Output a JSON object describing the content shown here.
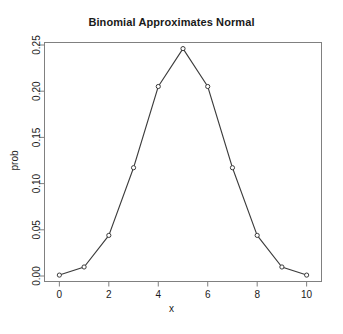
{
  "chart_data": {
    "type": "line",
    "title": "Binomial Approximates Normal",
    "xlabel": "x",
    "ylabel": "prob",
    "x": [
      0,
      1,
      2,
      3,
      4,
      5,
      6,
      7,
      8,
      9,
      10
    ],
    "values": [
      0.0009765625,
      0.009765625,
      0.043945313,
      0.1171875,
      0.205078125,
      0.24609375,
      0.205078125,
      0.1171875,
      0.043945313,
      0.009765625,
      0.0009765625
    ],
    "categories": [
      "0",
      "1",
      "2",
      "3",
      "4",
      "5",
      "6",
      "7",
      "8",
      "9",
      "10"
    ],
    "xlim": [
      -0.5,
      10.5
    ],
    "ylim": [
      0.0,
      0.25
    ],
    "xticks": [
      0,
      2,
      4,
      6,
      8,
      10
    ],
    "xtick_labels": [
      "0",
      "2",
      "4",
      "6",
      "8",
      "10"
    ],
    "yticks": [
      0.0,
      0.05,
      0.1,
      0.15,
      0.2,
      0.25
    ],
    "ytick_labels": [
      "0.00",
      "0.05",
      "0.10",
      "0.15",
      "0.20",
      "0.25"
    ],
    "grid": false,
    "legend": "none",
    "marker": "open-circle",
    "line_color": "#3c3c3c",
    "marker_color": "#3c3c3c",
    "box_color": "#808080",
    "background": "#ffffff"
  },
  "plot": {
    "title": "Binomial Approximates Normal",
    "x_label": "x",
    "y_label": "prob"
  }
}
